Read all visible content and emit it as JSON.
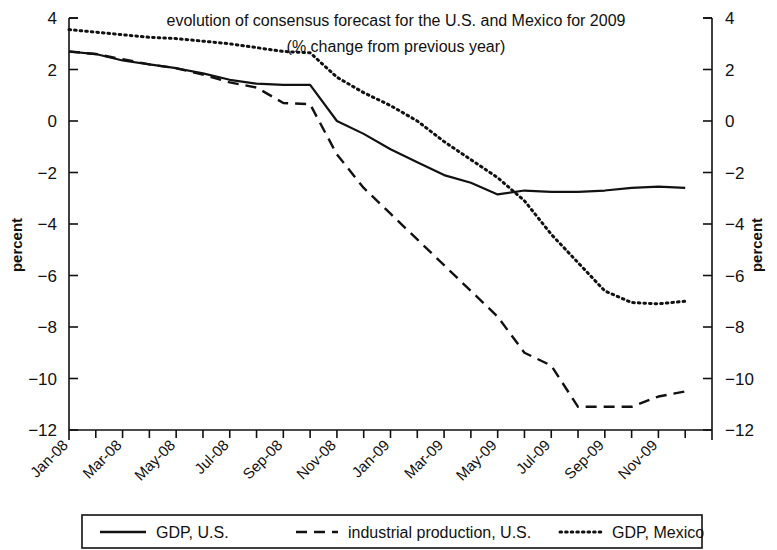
{
  "chart_data": {
    "type": "line",
    "title": "evolution of consensus forecast for the U.S. and Mexico for 2009",
    "subtitle": "(% change from previous year)",
    "xlabel": "",
    "ylabel": "percent",
    "ylabel_right": "percent",
    "ylim": [
      -12,
      4
    ],
    "yticks": [
      4,
      2,
      0,
      -2,
      -4,
      -6,
      -8,
      -10,
      -12
    ],
    "ytick_labels": [
      "4",
      "2",
      "0",
      "−2",
      "−4",
      "−6",
      "−8",
      "−10",
      "−12"
    ],
    "grid": false,
    "legend_position": "bottom",
    "x": [
      "Jan-08",
      "Feb-08",
      "Mar-08",
      "Apr-08",
      "May-08",
      "Jun-08",
      "Jul-08",
      "Aug-08",
      "Sep-08",
      "Oct-08",
      "Nov-08",
      "Dec-08",
      "Jan-09",
      "Feb-09",
      "Mar-09",
      "Apr-09",
      "May-09",
      "Jun-09",
      "Jul-09",
      "Aug-09",
      "Sep-09",
      "Oct-09",
      "Nov-09",
      "Dec-09"
    ],
    "xtick_labels": [
      "Jan-08",
      "",
      "Mar-08",
      "",
      "May-08",
      "",
      "Jul-08",
      "",
      "Sep-08",
      "",
      "Nov-08",
      "",
      "Jan-09",
      "",
      "Mar-09",
      "",
      "May-09",
      "",
      "Jul-09",
      "",
      "Sep-09",
      "",
      "Nov-09",
      ""
    ],
    "series": [
      {
        "name": "GDP, U.S.",
        "style": "solid",
        "color": "#111111",
        "values": [
          2.7,
          2.6,
          2.35,
          2.2,
          2.05,
          1.85,
          1.6,
          1.45,
          1.4,
          1.4,
          0.0,
          -0.5,
          -1.1,
          -1.6,
          -2.1,
          -2.4,
          -2.85,
          -2.7,
          -2.75,
          -2.75,
          -2.7,
          -2.6,
          -2.55,
          -2.6
        ]
      },
      {
        "name": "industrial production, U.S.",
        "style": "dashed",
        "color": "#111111",
        "values": [
          2.7,
          2.6,
          2.4,
          2.2,
          2.05,
          1.8,
          1.5,
          1.3,
          0.7,
          0.65,
          -1.3,
          -2.6,
          -3.6,
          -4.6,
          -5.6,
          -6.6,
          -7.6,
          -9.0,
          -9.5,
          -11.1,
          -11.1,
          -11.1,
          -10.7,
          -10.5
        ]
      },
      {
        "name": "GDP, Mexico",
        "style": "dotted",
        "color": "#111111",
        "values": [
          3.55,
          3.45,
          3.35,
          3.25,
          3.2,
          3.1,
          3.0,
          2.85,
          2.7,
          2.65,
          1.7,
          1.1,
          0.6,
          0.0,
          -0.8,
          -1.5,
          -2.2,
          -3.1,
          -4.4,
          -5.5,
          -6.6,
          -7.05,
          -7.1,
          -7.0
        ]
      }
    ]
  },
  "legend": {
    "items": [
      {
        "label": "GDP, U.S.",
        "style": "solid"
      },
      {
        "label": "industrial production, U.S.",
        "style": "dashed"
      },
      {
        "label": "GDP, Mexico",
        "style": "dotted"
      }
    ]
  }
}
